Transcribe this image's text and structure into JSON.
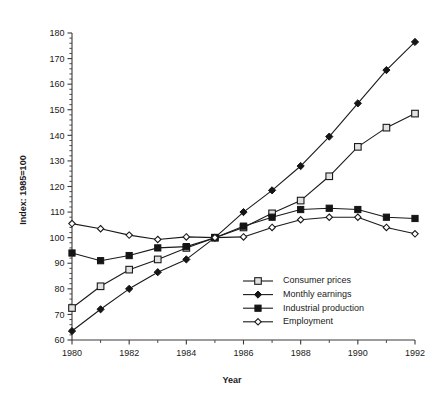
{
  "chart_data": {
    "type": "line",
    "title": "",
    "xlabel": "Year",
    "ylabel": "Index: 1985=100",
    "xlim": [
      1980,
      1992
    ],
    "ylim": [
      60,
      180
    ],
    "grid": false,
    "legend_position": "bottom-right",
    "x": [
      1980,
      1981,
      1982,
      1983,
      1984,
      1985,
      1986,
      1987,
      1988,
      1989,
      1990,
      1991,
      1992
    ],
    "x_tick_labels": [
      "1980",
      "1982",
      "1984",
      "1986",
      "1988",
      "1990",
      "1992"
    ],
    "x_ticks_major": [
      1980,
      1982,
      1984,
      1986,
      1988,
      1990,
      1992
    ],
    "x_ticks_minor": [
      1981,
      1983,
      1985,
      1987,
      1989,
      1991
    ],
    "y_tick_labels": [
      "60",
      "70",
      "80",
      "90",
      "100",
      "110",
      "120",
      "130",
      "140",
      "150",
      "160",
      "170",
      "180"
    ],
    "y_ticks_major": [
      60,
      70,
      80,
      90,
      100,
      110,
      120,
      130,
      140,
      150,
      160,
      170,
      180
    ],
    "y_minor_step": 2,
    "series": [
      {
        "name": "Consumer prices",
        "marker": "open-square",
        "values": [
          72.5,
          81.0,
          87.5,
          91.5,
          96.0,
          100.0,
          104.0,
          109.5,
          114.5,
          124.0,
          135.5,
          143.0,
          148.5
        ]
      },
      {
        "name": "Monthly earnings",
        "marker": "filled-diamond",
        "values": [
          63.5,
          72.0,
          80.0,
          86.5,
          91.5,
          100.0,
          110.0,
          118.5,
          128.0,
          139.5,
          152.5,
          165.5,
          176.5
        ]
      },
      {
        "name": "Industrial production",
        "marker": "filled-square",
        "values": [
          94.0,
          91.0,
          93.0,
          96.0,
          96.5,
          100.0,
          104.5,
          108.0,
          111.0,
          111.5,
          111.0,
          108.0,
          107.5
        ]
      },
      {
        "name": "Employment",
        "marker": "open-diamond",
        "values": [
          105.5,
          103.5,
          101.0,
          99.3,
          100.3,
          100.0,
          100.3,
          104.0,
          107.0,
          108.0,
          108.0,
          104.0,
          101.5
        ]
      }
    ]
  },
  "colors": {
    "ink": "#1a1a1a",
    "axis": "#3a3a3a",
    "background": "#ffffff",
    "marker_fill_open": "#e2e2e2"
  }
}
